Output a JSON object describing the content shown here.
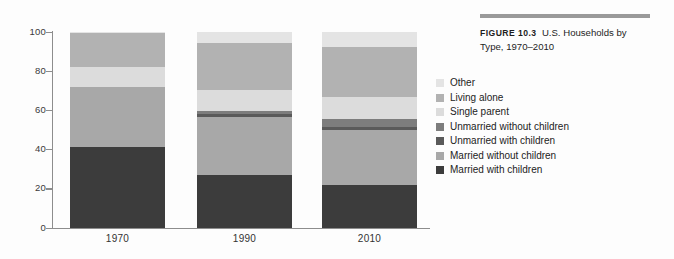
{
  "figure": {
    "label": "FIGURE 10.3",
    "caption": "U.S. Households by Type, 1970–2010",
    "rule_color": "#9a9a9a"
  },
  "legend": {
    "entries": [
      {
        "label": "Other",
        "color": "#e4e4e4"
      },
      {
        "label": "Living alone",
        "color": "#b2b2b2"
      },
      {
        "label": "Single parent",
        "color": "#dcdcdc"
      },
      {
        "label": "Unmarried without children",
        "color": "#7d7d7d"
      },
      {
        "label": "Unmarried with children",
        "color": "#5a5a5a"
      },
      {
        "label": "Married without children",
        "color": "#a8a8a8"
      },
      {
        "label": "Married with children",
        "color": "#3c3c3c"
      }
    ]
  },
  "axes": {
    "y_ticks": [
      "100",
      "80",
      "60",
      "40",
      "20",
      "0"
    ],
    "x_ticks": [
      "1970",
      "1990",
      "2010"
    ],
    "axis_color": "#8d8d8d"
  },
  "chart_data": {
    "type": "bar",
    "title": "U.S. Households by Type, 1970–2010",
    "subtitle": "FIGURE 10.3",
    "xlabel": "",
    "ylabel": "",
    "ylim": [
      0,
      100
    ],
    "grid": false,
    "stacked": true,
    "legend_position": "right",
    "categories": [
      "1970",
      "1990",
      "2010"
    ],
    "series": [
      {
        "name": "Married with children",
        "color": "#3c3c3c",
        "values": [
          41.0,
          27.0,
          21.5
        ]
      },
      {
        "name": "Married without children",
        "color": "#a8a8a8",
        "values": [
          30.5,
          29.5,
          28.5
        ]
      },
      {
        "name": "Unmarried with children",
        "color": "#5a5a5a",
        "values": [
          0.0,
          1.3,
          1.5
        ]
      },
      {
        "name": "Unmarried without children",
        "color": "#7d7d7d",
        "values": [
          0.0,
          1.7,
          4.0
        ]
      },
      {
        "name": "Single parent",
        "color": "#dcdcdc",
        "values": [
          10.5,
          10.5,
          11.0
        ]
      },
      {
        "name": "Living alone",
        "color": "#b2b2b2",
        "values": [
          17.0,
          24.0,
          25.5
        ]
      },
      {
        "name": "Other",
        "color": "#e4e4e4",
        "values": [
          1.0,
          6.0,
          8.0
        ]
      }
    ]
  }
}
